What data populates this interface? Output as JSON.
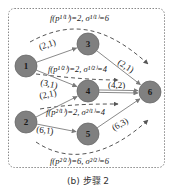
{
  "caption": "(b) 步骤 2",
  "colors": {
    "node_fill": "#808080",
    "node_stroke": "#6a6a6a",
    "edge": "#8a8a8a",
    "dashed": "#555555",
    "border": "#888888",
    "text": "#222222"
  },
  "nodes": [
    {
      "id": "1",
      "label": "1",
      "x": 26,
      "y": 66
    },
    {
      "id": "2",
      "label": "2",
      "x": 26,
      "y": 122
    },
    {
      "id": "3",
      "label": "3",
      "x": 88,
      "y": 44
    },
    {
      "id": "4",
      "label": "4",
      "x": 88,
      "y": 91
    },
    {
      "id": "5",
      "label": "5",
      "x": 88,
      "y": 134
    },
    {
      "id": "6",
      "label": "6",
      "x": 150,
      "y": 92
    }
  ],
  "edges": [
    {
      "from": "1",
      "to": "3",
      "label": "(2,1)",
      "lx": 40,
      "ly": 50,
      "rot": -18
    },
    {
      "from": "1",
      "to": "4",
      "label": "(3,1)",
      "lx": 40,
      "ly": 85,
      "rot": 12
    },
    {
      "from": "2",
      "to": "4",
      "label": "(2,1)",
      "lx": 40,
      "ly": 99,
      "rot": -12
    },
    {
      "from": "2",
      "to": "5",
      "label": "(6,1)",
      "lx": 36,
      "ly": 132,
      "rot": 8
    },
    {
      "from": "3",
      "to": "6",
      "label": "(2,1)",
      "lx": 117,
      "ly": 64,
      "rot": 32
    },
    {
      "from": "4",
      "to": "6",
      "label": "(4,2)",
      "lx": 108,
      "ly": 88,
      "rot": 0,
      "double": true
    },
    {
      "from": "5",
      "to": "6",
      "label": "(6,3)",
      "lx": 114,
      "ly": 131,
      "rot": -30
    }
  ],
  "flows": [
    {
      "name": "p1-1",
      "label": "f(p¹⁽¹⁾)=2, σ¹⁽¹⁾=6",
      "lx": 50,
      "ly": 21
    },
    {
      "name": "p1-2",
      "label": "f(p¹⁽²⁾)=2, σ¹⁽²⁾=4",
      "lx": 48,
      "ly": 72
    },
    {
      "name": "p2-1",
      "label": "f(p²⁽¹⁾)=2, σ²⁽¹⁾=4",
      "lx": 46,
      "ly": 115
    },
    {
      "name": "p2-2",
      "label": "f(p²⁽²⁾)=6, σ²⁽²⁾=6",
      "lx": 50,
      "ly": 164
    }
  ]
}
